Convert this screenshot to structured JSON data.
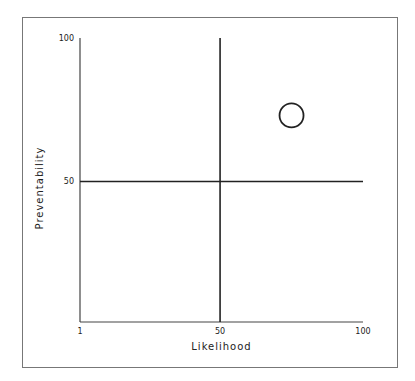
{
  "chart_data": {
    "type": "scatter",
    "title": "",
    "xlabel": "Likelihood",
    "ylabel": "Preventability",
    "xlim": [
      1,
      100
    ],
    "ylim": [
      1,
      100
    ],
    "x_ticks": [
      {
        "value": 1,
        "label": "1"
      },
      {
        "value": 50,
        "label": "50"
      },
      {
        "value": 100,
        "label": "100"
      }
    ],
    "y_ticks": [
      {
        "value": 50,
        "label": "50"
      },
      {
        "value": 100,
        "label": "100"
      }
    ],
    "quadrant_dividers": {
      "x": 50,
      "y": 50
    },
    "points": [
      {
        "x": 75,
        "y": 73,
        "marker": "open-circle"
      }
    ],
    "grid": false,
    "colors": {
      "ink": "#222222",
      "frame": "#777777"
    }
  }
}
